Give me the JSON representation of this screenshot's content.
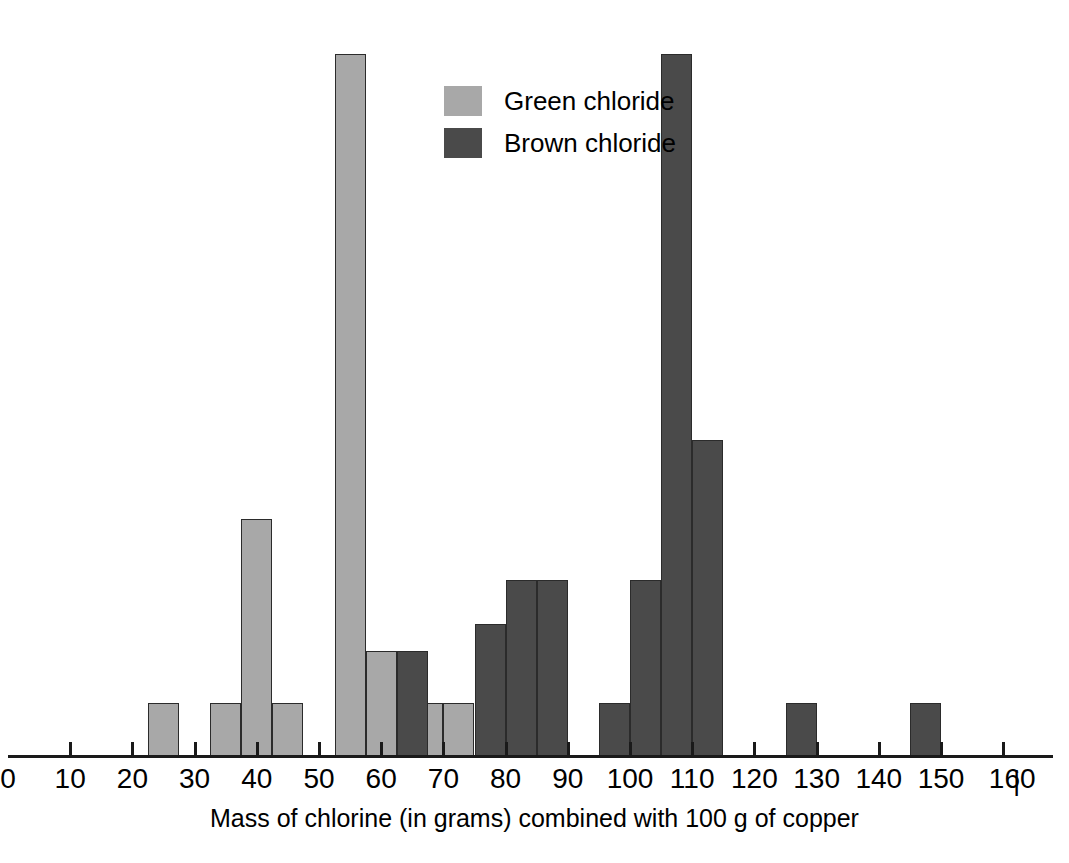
{
  "chart_data": {
    "type": "bar",
    "title": "",
    "xlabel": "Mass of chlorine (in grams) combined with 100 g of copper",
    "ylabel": "",
    "xlim": [
      0,
      160
    ],
    "xticks": [
      0,
      10,
      20,
      30,
      40,
      50,
      60,
      70,
      80,
      90,
      100,
      110,
      120,
      130,
      140,
      150,
      160
    ],
    "xtick_labels": [
      "0",
      "10",
      "20",
      "30",
      "40",
      "50",
      "60",
      "70",
      "80",
      "90",
      "100",
      "110",
      "120",
      "130",
      "140",
      "150",
      "160"
    ],
    "grid": false,
    "bin_width": 5,
    "legend_position": "upper-center",
    "series": [
      {
        "name": "Green chloride",
        "color": "#a8a8a8",
        "bins": [
          {
            "x0": 22.5,
            "x1": 27.5,
            "height": 6
          },
          {
            "x0": 32.5,
            "x1": 37.5,
            "height": 6
          },
          {
            "x0": 37.5,
            "x1": 42.5,
            "height": 27
          },
          {
            "x0": 42.5,
            "x1": 47.5,
            "height": 6
          },
          {
            "x0": 52.5,
            "x1": 57.5,
            "height": 80
          },
          {
            "x0": 57.5,
            "x1": 62.5,
            "height": 12
          },
          {
            "x0": 65.0,
            "x1": 70.0,
            "height": 6
          },
          {
            "x0": 70.0,
            "x1": 75.0,
            "height": 6
          }
        ]
      },
      {
        "name": "Brown chloride",
        "color": "#4a4a4a",
        "bins": [
          {
            "x0": 62.5,
            "x1": 67.5,
            "height": 12
          },
          {
            "x0": 75.0,
            "x1": 80.0,
            "height": 15
          },
          {
            "x0": 80.0,
            "x1": 85.0,
            "height": 20
          },
          {
            "x0": 85.0,
            "x1": 90.0,
            "height": 20
          },
          {
            "x0": 95.0,
            "x1": 100.0,
            "height": 6
          },
          {
            "x0": 100.0,
            "x1": 105.0,
            "height": 20
          },
          {
            "x0": 105.0,
            "x1": 110.0,
            "height": 80
          },
          {
            "x0": 110.0,
            "x1": 115.0,
            "height": 36
          },
          {
            "x0": 125.0,
            "x1": 130.0,
            "height": 6
          },
          {
            "x0": 145.0,
            "x1": 150.0,
            "height": 6
          }
        ]
      }
    ]
  },
  "legend": {
    "items": [
      {
        "label": "Green chloride",
        "swatch": "green"
      },
      {
        "label": "Brown chloride",
        "swatch": "brown"
      }
    ]
  },
  "axis": {
    "title": "Mass of chlorine (in grams) combined with 100 g of copper",
    "end_divider": "|",
    "labels": [
      "0",
      "10",
      "20",
      "30",
      "40",
      "50",
      "60",
      "70",
      "80",
      "90",
      "100",
      "110",
      "120",
      "130",
      "140",
      "150",
      "160"
    ]
  },
  "colors": {
    "green_chloride": "#a8a8a8",
    "brown_chloride": "#4a4a4a",
    "axis": "#1a1a1a",
    "background": "#ffffff"
  }
}
